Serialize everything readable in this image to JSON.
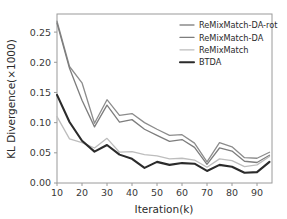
{
  "chart_data": {
    "type": "line",
    "title": "",
    "xlabel": "Iteration(k)",
    "ylabel": "KL Divergence(×1000)",
    "xlim": [
      10,
      96
    ],
    "ylim": [
      0.0,
      0.28
    ],
    "xticks": [
      10,
      20,
      30,
      40,
      50,
      60,
      70,
      80,
      90
    ],
    "xtick_labels": [
      "10",
      "20",
      "30",
      "40",
      "50",
      "60",
      "70",
      "80",
      "90"
    ],
    "yticks": [
      0.0,
      0.05,
      0.1,
      0.15,
      0.2,
      0.25
    ],
    "ytick_labels": [
      "0.00",
      "0.05",
      "0.10",
      "0.15",
      "0.20",
      "0.25"
    ],
    "grid": false,
    "legend_position": "upper right",
    "x": [
      10,
      15,
      20,
      25,
      30,
      35,
      40,
      45,
      50,
      55,
      60,
      65,
      70,
      75,
      80,
      85,
      90,
      95
    ],
    "series": [
      {
        "name": "ReMixMatch-DA-rot",
        "color": "#8c8c8c",
        "width": 1.3,
        "values": [
          0.268,
          0.193,
          0.166,
          0.099,
          0.138,
          0.112,
          0.115,
          0.1,
          0.089,
          0.079,
          0.08,
          0.066,
          0.035,
          0.067,
          0.06,
          0.042,
          0.041,
          0.051
        ]
      },
      {
        "name": "ReMixMatch-DA",
        "color": "#7d7d7d",
        "width": 1.3,
        "values": [
          0.265,
          0.19,
          0.137,
          0.093,
          0.129,
          0.101,
          0.105,
          0.089,
          0.079,
          0.069,
          0.072,
          0.059,
          0.031,
          0.058,
          0.053,
          0.036,
          0.034,
          0.046
        ]
      },
      {
        "name": "ReMixMatch",
        "color": "#bdbdbd",
        "width": 1.3,
        "values": [
          0.11,
          0.073,
          0.067,
          0.058,
          0.074,
          0.051,
          0.052,
          0.047,
          0.045,
          0.04,
          0.041,
          0.038,
          0.026,
          0.04,
          0.037,
          0.027,
          0.03,
          0.044
        ]
      },
      {
        "name": "BTDA",
        "color": "#2b2b2b",
        "width": 2.1,
        "values": [
          0.146,
          0.101,
          0.07,
          0.052,
          0.063,
          0.047,
          0.04,
          0.025,
          0.035,
          0.03,
          0.033,
          0.032,
          0.02,
          0.03,
          0.027,
          0.017,
          0.018,
          0.035
        ]
      }
    ]
  },
  "legend": {
    "entries": [
      {
        "label": "ReMixMatch-DA-rot"
      },
      {
        "label": "ReMixMatch-DA"
      },
      {
        "label": "ReMixMatch"
      },
      {
        "label": "BTDA"
      }
    ]
  }
}
